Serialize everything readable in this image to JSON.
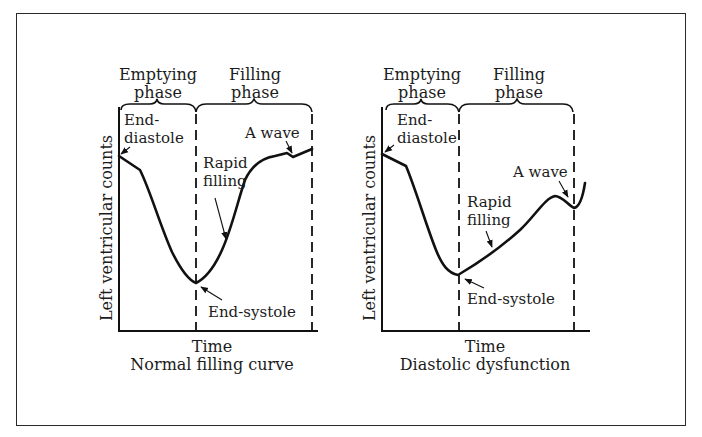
{
  "figure": {
    "panels": [
      {
        "id": "normal",
        "caption": "Normal filling curve",
        "xlabel": "Time",
        "ylabel": "Left ventricular counts",
        "phases": [
          {
            "line1": "Emptying",
            "line2": "phase"
          },
          {
            "line1": "Filling",
            "line2": "phase"
          }
        ],
        "annotations": {
          "end_diastole_1": "End-",
          "end_diastole_2": "diastole",
          "a_wave": "A wave",
          "rapid_filling_1": "Rapid",
          "rapid_filling_2": "filling",
          "end_systole": "End-systole"
        }
      },
      {
        "id": "diastolic",
        "caption": "Diastolic dysfunction",
        "xlabel": "Time",
        "ylabel": "Left ventricular counts",
        "phases": [
          {
            "line1": "Emptying",
            "line2": "phase"
          },
          {
            "line1": "Filling",
            "line2": "phase"
          }
        ],
        "annotations": {
          "end_diastole_1": "End-",
          "end_diastole_2": "diastole",
          "a_wave": "A wave",
          "rapid_filling_1": "Rapid",
          "rapid_filling_2": "filling",
          "end_systole": "End-systole"
        }
      }
    ]
  }
}
